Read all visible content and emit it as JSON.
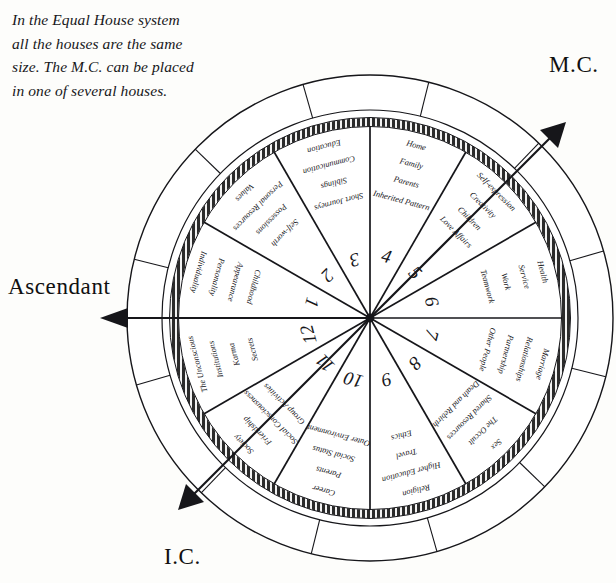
{
  "caption": {
    "lines": [
      "In the Equal House system",
      "all the houses are the same",
      "size. The M.C. can be placed",
      "in one of several houses."
    ],
    "text": "In the Equal House system all the houses are the same size. The M.C. can be placed in one of several houses."
  },
  "axes": {
    "mc": {
      "label": "M.C.",
      "arrow": "arrow-up-right"
    },
    "ascendant": {
      "label": "Ascendant",
      "arrow": "arrow-left"
    },
    "ic": {
      "label": "I.C.",
      "arrow": "arrow-down-left"
    }
  },
  "wheel": {
    "center": {
      "x": 370,
      "y": 318
    },
    "radii": {
      "outer": 243,
      "ring_inner": 208,
      "band_outer": 200,
      "band_inner": 192
    },
    "house_count": 12,
    "outer_ring_divisions": 12,
    "colors": {
      "ink": "#16161a",
      "band": "#2a2a2a",
      "paper": "#ffffff",
      "background": "#fdfdfb"
    }
  },
  "chart_data": {
    "type": "pie",
    "categories": [
      "1",
      "2",
      "3",
      "4",
      "5",
      "6",
      "7",
      "8",
      "9",
      "10",
      "11",
      "12"
    ],
    "values": [
      30,
      30,
      30,
      30,
      30,
      30,
      30,
      30,
      30,
      30,
      30,
      30
    ],
    "xlabel": "",
    "ylabel": "",
    "legend_position": "none",
    "grid": false
  },
  "houses": [
    {
      "number": "1",
      "keywords": [
        "Individuality",
        "Personality",
        "Appearance",
        "Childhood"
      ]
    },
    {
      "number": "2",
      "keywords": [
        "Values",
        "Personal Resources",
        "Possessions",
        "Self-worth"
      ]
    },
    {
      "number": "3",
      "keywords": [
        "Education",
        "Communication",
        "Siblings",
        "Short Journeys"
      ]
    },
    {
      "number": "4",
      "keywords": [
        "Home",
        "Family",
        "Parents",
        "Inherited Pattern"
      ]
    },
    {
      "number": "5",
      "keywords": [
        "Self-expression",
        "Creativity",
        "Children",
        "Love Affairs"
      ]
    },
    {
      "number": "6",
      "keywords": [
        "Health",
        "Service",
        "Work",
        "Teamwork"
      ]
    },
    {
      "number": "7",
      "keywords": [
        "Marriage",
        "Relationships",
        "Partnership",
        "Other People"
      ]
    },
    {
      "number": "8",
      "keywords": [
        "Sex",
        "The Occult",
        "Shared Resources",
        "Death and Rebirth"
      ]
    },
    {
      "number": "9",
      "keywords": [
        "Religion",
        "Higher Education",
        "Travel",
        "Ethics"
      ]
    },
    {
      "number": "10",
      "keywords": [
        "Career",
        "Parents",
        "Social Status",
        "Outer Environment"
      ]
    },
    {
      "number": "11",
      "keywords": [
        "Society",
        "Friendship",
        "Social Consciousness",
        "Group Activities"
      ]
    },
    {
      "number": "12",
      "keywords": [
        "The Unconscious",
        "Institutions",
        "Karma",
        "Secrets"
      ]
    }
  ]
}
